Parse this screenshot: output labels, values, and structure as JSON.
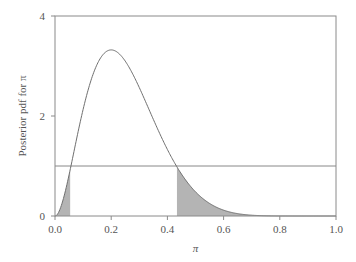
{
  "chart_data": {
    "type": "area",
    "title": "",
    "xlabel": "π",
    "ylabel": "Posterior pdf for π",
    "xlim": [
      0.0,
      1.0
    ],
    "ylim": [
      0,
      4
    ],
    "x_ticks": [
      "0.0",
      "0.2",
      "0.4",
      "0.6",
      "0.8",
      "1.0"
    ],
    "y_ticks": [
      "0",
      "2",
      "4"
    ],
    "grid": false,
    "legend": null,
    "series": [
      {
        "name": "Posterior density (Beta(3, 9))",
        "kind": "line",
        "distribution": {
          "family": "beta",
          "a": 3,
          "b": 9
        },
        "x": [
          0.0,
          0.05,
          0.1,
          0.15,
          0.2,
          0.25,
          0.3,
          0.35,
          0.4,
          0.45,
          0.5,
          0.55,
          0.6,
          0.7,
          0.8,
          0.9,
          1.0
        ],
        "values": [
          0.0,
          0.83,
          2.13,
          3.0,
          3.32,
          3.1,
          2.54,
          1.85,
          1.2,
          0.7,
          0.35,
          0.16,
          0.06,
          0.01,
          0.0,
          0.0,
          0.0
        ]
      },
      {
        "name": "Horizontal reference line",
        "kind": "hline",
        "y": 1.0
      }
    ],
    "shaded_regions": [
      {
        "from": 0.0,
        "to": 0.054,
        "under": "Posterior density (Beta(3, 9))"
      },
      {
        "from": 0.434,
        "to": 1.0,
        "under": "Posterior density (Beta(3, 9))"
      }
    ],
    "annotations": [],
    "colors": {
      "line": "#6f6f6f",
      "shade": "#b4b4b4",
      "axis": "#8a8a8a",
      "text": "#555555"
    }
  }
}
